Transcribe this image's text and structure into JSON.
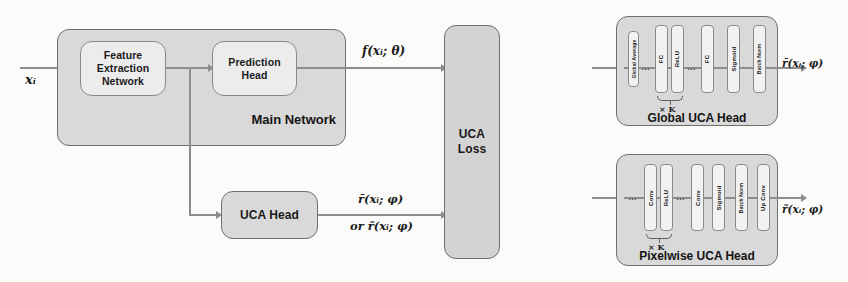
{
  "figure": {
    "input_label": "xᵢ",
    "main_network": {
      "title": "Main Network",
      "blocks": [
        {
          "id": "feature-extraction-network",
          "label": "Feature\nExtraction\nNetwork"
        },
        {
          "id": "prediction-head",
          "label": "Prediction\nHead"
        }
      ],
      "output_label": "f(xᵢ; θ)"
    },
    "uca_head": {
      "label": "UCA Head",
      "output_label_primary": "r̄(xᵢ; φ)",
      "output_label_secondary": "or  r̃(xᵢ; φ)"
    },
    "uca_loss": {
      "label": "UCA\nLoss"
    },
    "global_uca_head": {
      "title": "Global UCA Head",
      "blocks": [
        {
          "id": "global-average",
          "label": "Global Average"
        },
        {
          "id": "ellipsis-1",
          "label": "…"
        },
        {
          "id": "fc-1",
          "label": "FC"
        },
        {
          "id": "relu",
          "label": "ReLU"
        },
        {
          "id": "ellipsis-2",
          "label": "…"
        },
        {
          "id": "fc-2",
          "label": "FC"
        },
        {
          "id": "sigmoid",
          "label": "Sigmoid"
        },
        {
          "id": "batch-norm",
          "label": "Batch Norm"
        }
      ],
      "repeat_label": "× K",
      "output_label": "r̄(xᵢ; φ)"
    },
    "pixelwise_uca_head": {
      "title": "Pixelwise UCA Head",
      "blocks": [
        {
          "id": "ellipsis-1",
          "label": "…"
        },
        {
          "id": "conv-1",
          "label": "Conv"
        },
        {
          "id": "relu",
          "label": "ReLU"
        },
        {
          "id": "ellipsis-2",
          "label": "…"
        },
        {
          "id": "conv-2",
          "label": "Conv"
        },
        {
          "id": "sigmoid",
          "label": "Sigmoid"
        },
        {
          "id": "batch-norm",
          "label": "Batch Norm"
        },
        {
          "id": "up-conv",
          "label": "Up Conv"
        }
      ],
      "repeat_label": "× K",
      "output_label": "r̃(xᵢ; φ)"
    },
    "colors": {
      "container_fill": "#d9d9d9",
      "inner_fill": "#ececec",
      "block_fill": "#f2f2f2",
      "stroke": "#6f6f6f",
      "arrow": "#8d8d8d",
      "text": "#1a1a1a",
      "background": "#fbfbfa"
    }
  }
}
